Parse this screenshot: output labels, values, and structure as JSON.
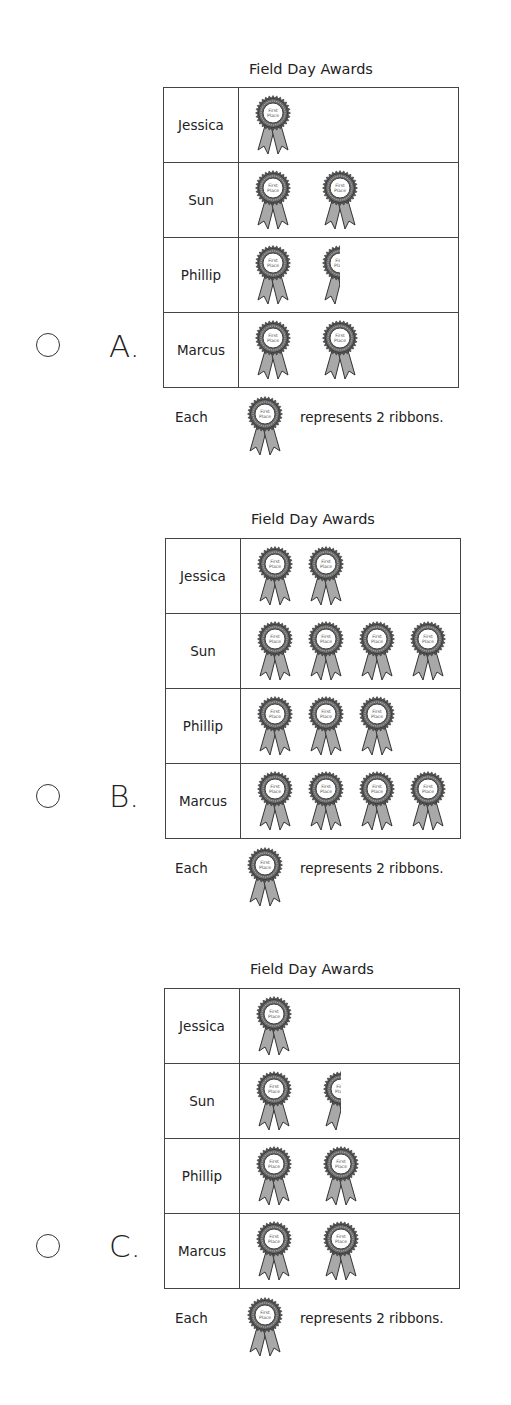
{
  "question_top_fragment": "",
  "chart_data": [
    {
      "type": "table",
      "option": "A",
      "title": "Field Day Awards",
      "rows": [
        {
          "name": "Jessica",
          "symbols": 1
        },
        {
          "name": "Sun",
          "symbols": 2
        },
        {
          "name": "Phillip",
          "symbols": 1.5
        },
        {
          "name": "Marcus",
          "symbols": 2
        }
      ],
      "symbol_label": "First Place",
      "key": {
        "prefix": "Each",
        "suffix": "represents 2 ribbons.",
        "value_per_symbol": 2
      },
      "represented_ribbons": {
        "Jessica": 2,
        "Sun": 4,
        "Phillip": 3,
        "Marcus": 4
      }
    },
    {
      "type": "table",
      "option": "B",
      "title": "Field Day Awards",
      "rows": [
        {
          "name": "Jessica",
          "symbols": 2
        },
        {
          "name": "Sun",
          "symbols": 4
        },
        {
          "name": "Phillip",
          "symbols": 3
        },
        {
          "name": "Marcus",
          "symbols": 4
        }
      ],
      "symbol_label": "First Place",
      "key": {
        "prefix": "Each",
        "suffix": "represents 2 ribbons.",
        "value_per_symbol": 2
      },
      "represented_ribbons": {
        "Jessica": 4,
        "Sun": 8,
        "Phillip": 6,
        "Marcus": 8
      }
    },
    {
      "type": "table",
      "option": "C",
      "title": "Field Day Awards",
      "rows": [
        {
          "name": "Jessica",
          "symbols": 1
        },
        {
          "name": "Sun",
          "symbols": 1.5
        },
        {
          "name": "Phillip",
          "symbols": 2
        },
        {
          "name": "Marcus",
          "symbols": 2
        }
      ],
      "symbol_label": "First Place",
      "key": {
        "prefix": "Each",
        "suffix": "represents 2 ribbons.",
        "value_per_symbol": 2
      },
      "represented_ribbons": {
        "Jessica": 2,
        "Sun": 3,
        "Phillip": 4,
        "Marcus": 4
      }
    }
  ],
  "options": [
    {
      "letter": "A.",
      "title": "Field Day Awards",
      "rows": [
        {
          "name": "Jessica"
        },
        {
          "name": "Sun"
        },
        {
          "name": "Phillip"
        },
        {
          "name": "Marcus"
        }
      ],
      "key_prefix": "Each",
      "key_suffix": "represents 2 ribbons."
    },
    {
      "letter": "B.",
      "title": "Field Day Awards",
      "rows": [
        {
          "name": "Jessica"
        },
        {
          "name": "Sun"
        },
        {
          "name": "Phillip"
        },
        {
          "name": "Marcus"
        }
      ],
      "key_prefix": "Each",
      "key_suffix": "represents 2 ribbons."
    },
    {
      "letter": "C.",
      "title": "Field Day Awards",
      "rows": [
        {
          "name": "Jessica"
        },
        {
          "name": "Sun"
        },
        {
          "name": "Phillip"
        },
        {
          "name": "Marcus"
        }
      ],
      "key_prefix": "Each",
      "key_suffix": "represents 2 ribbons."
    }
  ],
  "medal": {
    "line1": "First",
    "line2": "Place",
    "rosette_color": "#555555",
    "ribbon_color": "#a8a8a8",
    "center_color": "#ffffff"
  }
}
